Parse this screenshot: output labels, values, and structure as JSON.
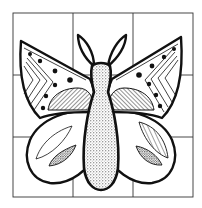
{
  "image": {
    "subject": "butterfly",
    "description": "Black-and-white line drawing of a symmetrical butterfly placed over a 3x3 grid, with decorated wings (dots, chevron stripes, hatched half-circles, striped and stippled leaf shapes) and a stippled body with two antennae.",
    "style": "coloring-page line art"
  },
  "grid": {
    "rows": 3,
    "cols": 3,
    "line_color": "#333333"
  },
  "colors": {
    "ink": "#111111",
    "paper": "#ffffff"
  },
  "parts": {
    "upper_wings": [
      "dotted-band",
      "chevron-stripes",
      "hatched-half-circle"
    ],
    "lower_wings": [
      "striped-leaf",
      "stippled-leaf"
    ],
    "body": "stippled",
    "antennae": 2
  }
}
